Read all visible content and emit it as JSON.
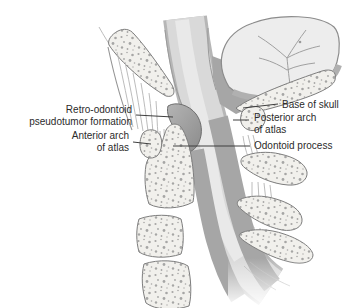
{
  "figure": {
    "labels": {
      "retro_odontoid_line1": "Retro-odontoid",
      "retro_odontoid_line2": "pseudotumor formation",
      "anterior_arch_line1": "Anterior arch",
      "anterior_arch_line2": "of atlas",
      "base_of_skull": "Base of skull",
      "posterior_arch_line1": "Posterior arch",
      "posterior_arch_line2": "of atlas",
      "odontoid_process": "Odontoid process"
    },
    "colors": {
      "background": "#ffffff",
      "bone_fill": "#f1f0ec",
      "bone_outline": "#7d7d7d",
      "speckle": "#8d8d8d",
      "cord_fill": "#d9d9d9",
      "cord_edge": "#b6b6b6",
      "cord_highlight": "#e9e9e9",
      "shadow": "#a6a6a6",
      "pseudotumor": "#9d9d9d",
      "cerebellum_fill": "#ededed",
      "leader_line": "#3f3f3f",
      "label_text": "#2b2b2b"
    }
  }
}
